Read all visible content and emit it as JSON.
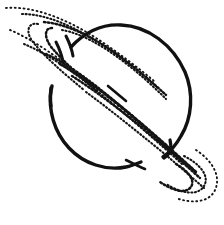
{
  "image": {
    "title": "Saturn",
    "subject": "saturn-planet-with-rings",
    "style": "hand-drawn ink line art, stippled rings",
    "width": 224,
    "height": 225,
    "background_color": "#ffffff",
    "ink_color": "#111111",
    "caption": "Line drawing of the planet Saturn with tilted dotted ring system"
  },
  "planet": {
    "label": "Saturn planet body",
    "shape": "circle",
    "center_x": 120,
    "center_y": 96,
    "radius": 70,
    "stroke_width": 3.4,
    "fill": "none",
    "stroke_color": "#111111",
    "outline_gaps": [
      {
        "name": "upper-left-ring-crossing",
        "start_deg": 188,
        "end_deg": 214
      },
      {
        "name": "lower-right-ring-crossing",
        "start_deg": 8,
        "end_deg": 26
      }
    ]
  },
  "rings": {
    "label": "Saturn ring system",
    "tilt_degrees": 33,
    "render": "stippled dotted arcs",
    "band_count": 6,
    "bands": [
      {
        "name": "outer-ring-band-a",
        "texture": "ring-dotted-sparse",
        "offset": -20
      },
      {
        "name": "outer-ring-band-b",
        "texture": "ring-dotted-fine",
        "offset": -12
      },
      {
        "name": "mid-ring-band-c",
        "texture": "ring-dotted-med",
        "offset": -4
      },
      {
        "name": "mid-ring-band-d",
        "texture": "ring-dotted-coarse",
        "offset": 4
      },
      {
        "name": "inner-ring-band-e",
        "texture": "ring-dotted-med",
        "offset": 12
      },
      {
        "name": "inner-ring-band-f",
        "texture": "ring-dotted-fine",
        "offset": 20
      }
    ],
    "tips": [
      {
        "name": "upper-left-ring-tip",
        "x": 60,
        "y": 34
      },
      {
        "name": "lower-right-ring-tip",
        "x": 196,
        "y": 180
      }
    ],
    "solid_accents": [
      {
        "name": "upper-left-solid-ring-stub",
        "x1": 66,
        "y1": 36,
        "x2": 74,
        "y2": 54
      },
      {
        "name": "lower-left-solid-ring-stub",
        "x1": 52,
        "y1": 88,
        "x2": 50,
        "y2": 100
      }
    ]
  }
}
